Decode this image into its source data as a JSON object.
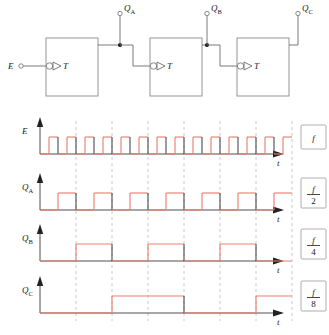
{
  "figure": {
    "accent_color": "#e8806e",
    "wire_color": "#6b6b6b",
    "grid_color": "#9aa0a6"
  },
  "circuit": {
    "input": {
      "label": "E",
      "terminal": "open-circle"
    },
    "flipflops": [
      {
        "id": "ff1",
        "input_label": "T",
        "output_label": "Q",
        "output_sub": "A",
        "clock_inverting": true
      },
      {
        "id": "ff2",
        "input_label": "T",
        "output_label": "Q",
        "output_sub": "B",
        "clock_inverting": true
      },
      {
        "id": "ff3",
        "input_label": "T",
        "output_label": "Q",
        "output_sub": "C",
        "clock_inverting": true
      }
    ],
    "outputs": [
      {
        "label": "Q",
        "sub": "A",
        "terminal": "open-circle"
      },
      {
        "label": "Q",
        "sub": "B",
        "terminal": "open-circle"
      },
      {
        "label": "Q",
        "sub": "C",
        "terminal": "open-circle"
      }
    ],
    "junction_nodes": 2
  },
  "timing": {
    "time_axis_label": "t",
    "rows": [
      {
        "name": "E",
        "label": "E",
        "sub": "",
        "divider": 1,
        "cycles": 14,
        "freq_label": "f",
        "freq_num": "f",
        "freq_den": ""
      },
      {
        "name": "QA",
        "label": "Q",
        "sub": "A",
        "divider": 2,
        "cycles": 7,
        "freq_label": "f/2",
        "freq_num": "f",
        "freq_den": "2"
      },
      {
        "name": "QB",
        "label": "Q",
        "sub": "B",
        "divider": 4,
        "cycles": 3.5,
        "freq_label": "f/4",
        "freq_num": "f",
        "freq_den": "4"
      },
      {
        "name": "QC",
        "label": "Q",
        "sub": "C",
        "divider": 8,
        "cycles": 1.75,
        "freq_label": "f/8",
        "freq_num": "f",
        "freq_den": "8"
      }
    ]
  },
  "chart_data": {
    "type": "line",
    "xlabel": "t",
    "ylabel": "",
    "grid": true,
    "legend": "none",
    "series": [
      {
        "name": "E",
        "divider": 1,
        "period_px": 18,
        "duty": 0.5,
        "pulses": 14
      },
      {
        "name": "QA",
        "divider": 2,
        "period_px": 36,
        "duty": 0.5,
        "pulses": 7
      },
      {
        "name": "QB",
        "divider": 4,
        "period_px": 72,
        "duty": 0.5,
        "pulses": 3.5
      },
      {
        "name": "QC",
        "divider": 8,
        "period_px": 144,
        "duty": 0.5,
        "pulses": 1.75
      }
    ],
    "annotations": [
      "f",
      "f/2",
      "f/4",
      "f/8"
    ]
  }
}
